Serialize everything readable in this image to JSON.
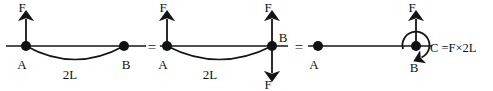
{
  "figure": {
    "type": "engineering-free-body-diagram",
    "background_color": "#ffffff",
    "ink_color": "#141414",
    "width": 493,
    "height": 91
  },
  "equals_signs": [
    {
      "symbol": "=",
      "x": 150,
      "y": 47
    },
    {
      "symbol": "=",
      "x": 297,
      "y": 47
    }
  ],
  "panels": [
    {
      "id": "panel-1",
      "name": "original-force-at-A",
      "baseline_y": 46,
      "line": {
        "x1": 6,
        "x2": 146
      },
      "arc": {
        "from_x": 26,
        "to_x": 124,
        "sag": 18
      },
      "nodes": [
        {
          "label": "A",
          "x": 26,
          "y": 46,
          "label_x": 22,
          "label_y": 68
        },
        {
          "label": "B",
          "x": 124,
          "y": 46,
          "label_x": 120,
          "label_y": 68
        }
      ],
      "arrows": [
        {
          "label": "F",
          "at_x": 26,
          "direction": "up",
          "length": 30,
          "label_x": 22,
          "label_y": 12
        }
      ],
      "span_label": {
        "text": "2L",
        "x": 68,
        "y": 78
      }
    },
    {
      "id": "panel-2",
      "name": "force-pair-added-at-B",
      "baseline_y": 46,
      "line": {
        "x1": 160,
        "x2": 288
      },
      "arc": {
        "from_x": 167,
        "to_x": 272,
        "sag": 18
      },
      "nodes": [
        {
          "label": "A",
          "x": 167,
          "y": 46,
          "label_x": 163,
          "label_y": 68
        },
        {
          "label": "B",
          "x": 272,
          "y": 46,
          "label_x": 281,
          "label_y": 42
        }
      ],
      "arrows": [
        {
          "label": "F",
          "at_x": 167,
          "direction": "up",
          "length": 30,
          "label_x": 163,
          "label_y": 12
        },
        {
          "label": "F",
          "at_x": 272,
          "direction": "up",
          "length": 30,
          "label_x": 268,
          "label_y": 12
        },
        {
          "label": "F",
          "at_x": 272,
          "direction": "down",
          "length": 30,
          "label_x": 268,
          "label_y": 89
        }
      ],
      "span_label": {
        "text": "2L",
        "x": 208,
        "y": 78
      }
    },
    {
      "id": "panel-3",
      "name": "equivalent-force-and-couple-at-B",
      "baseline_y": 46,
      "line": {
        "x1": 308,
        "x2": 478
      },
      "nodes": [
        {
          "label": "A",
          "x": 318,
          "y": 46,
          "label_x": 314,
          "label_y": 68
        },
        {
          "label": "B",
          "x": 416,
          "y": 46,
          "label_x": 412,
          "label_y": 70
        }
      ],
      "arrows": [
        {
          "label": "F",
          "at_x": 416,
          "direction": "up",
          "length": 30,
          "label_x": 412,
          "label_y": 12
        }
      ],
      "moment": {
        "at_x": 416,
        "at_y": 46,
        "radius": 13,
        "direction": "clockwise",
        "label": "C =F×2L",
        "label_x": 432,
        "label_y": 52
      }
    }
  ],
  "labels": {
    "force": "F",
    "point_a": "A",
    "point_b": "B",
    "span": "2L",
    "moment": "C =F×2L",
    "equals": "="
  }
}
